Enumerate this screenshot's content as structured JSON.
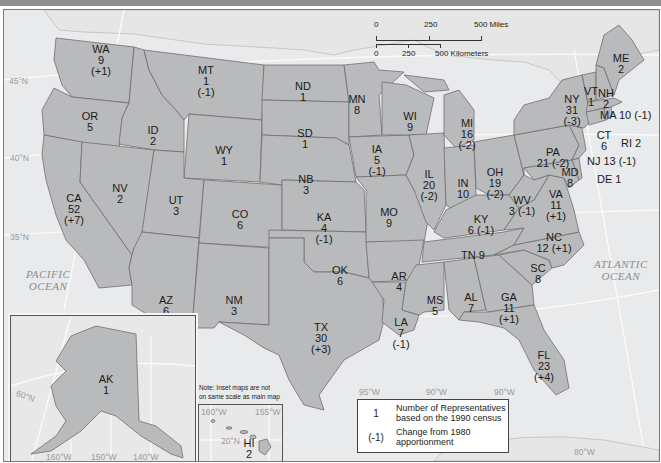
{
  "map": {
    "type": "choropleth-labeled",
    "subject": "U.S. House apportionment by state after the 1990 census",
    "states": [
      {
        "abbr": "WA",
        "reps": "9",
        "change": "(+1)"
      },
      {
        "abbr": "OR",
        "reps": "5",
        "change": ""
      },
      {
        "abbr": "CA",
        "reps": "52",
        "change": "(+7)"
      },
      {
        "abbr": "ID",
        "reps": "2",
        "change": ""
      },
      {
        "abbr": "NV",
        "reps": "2",
        "change": ""
      },
      {
        "abbr": "MT",
        "reps": "1",
        "change": "(-1)"
      },
      {
        "abbr": "WY",
        "reps": "1",
        "change": ""
      },
      {
        "abbr": "UT",
        "reps": "3",
        "change": ""
      },
      {
        "abbr": "AZ",
        "reps": "6",
        "change": "(+1)"
      },
      {
        "abbr": "CO",
        "reps": "6",
        "change": ""
      },
      {
        "abbr": "NM",
        "reps": "3",
        "change": ""
      },
      {
        "abbr": "ND",
        "reps": "1",
        "change": ""
      },
      {
        "abbr": "SD",
        "reps": "1",
        "change": ""
      },
      {
        "abbr": "NB",
        "reps": "3",
        "change": ""
      },
      {
        "abbr": "KA",
        "reps": "4",
        "change": "(-1)"
      },
      {
        "abbr": "OK",
        "reps": "6",
        "change": ""
      },
      {
        "abbr": "TX",
        "reps": "30",
        "change": "(+3)"
      },
      {
        "abbr": "MN",
        "reps": "8",
        "change": ""
      },
      {
        "abbr": "IA",
        "reps": "5",
        "change": "(-1)"
      },
      {
        "abbr": "MO",
        "reps": "9",
        "change": ""
      },
      {
        "abbr": "AR",
        "reps": "4",
        "change": ""
      },
      {
        "abbr": "LA",
        "reps": "7",
        "change": "(-1)"
      },
      {
        "abbr": "WI",
        "reps": "9",
        "change": ""
      },
      {
        "abbr": "IL",
        "reps": "20",
        "change": "(-2)"
      },
      {
        "abbr": "MI",
        "reps": "16",
        "change": "(-2)"
      },
      {
        "abbr": "IN",
        "reps": "10",
        "change": ""
      },
      {
        "abbr": "OH",
        "reps": "19",
        "change": "(-2)"
      },
      {
        "abbr": "KY",
        "reps": "6",
        "change": "(-1)"
      },
      {
        "abbr": "TN",
        "reps": "9",
        "change": ""
      },
      {
        "abbr": "MS",
        "reps": "5",
        "change": ""
      },
      {
        "abbr": "AL",
        "reps": "7",
        "change": ""
      },
      {
        "abbr": "GA",
        "reps": "11",
        "change": "(+1)"
      },
      {
        "abbr": "FL",
        "reps": "23",
        "change": "(+4)"
      },
      {
        "abbr": "SC",
        "reps": "8",
        "change": ""
      },
      {
        "abbr": "NC",
        "reps": "12",
        "change": "(+1)"
      },
      {
        "abbr": "VA",
        "reps": "11",
        "change": "(+1)"
      },
      {
        "abbr": "WV",
        "reps": "3",
        "change": "(-1)"
      },
      {
        "abbr": "PA",
        "reps": "21",
        "change": "(-2)"
      },
      {
        "abbr": "NY",
        "reps": "31",
        "change": "(-3)"
      },
      {
        "abbr": "VT",
        "reps": "1",
        "change": ""
      },
      {
        "abbr": "NH",
        "reps": "2",
        "change": ""
      },
      {
        "abbr": "ME",
        "reps": "2",
        "change": ""
      },
      {
        "abbr": "MA",
        "reps": "10",
        "change": "(-1)"
      },
      {
        "abbr": "RI",
        "reps": "2",
        "change": ""
      },
      {
        "abbr": "CT",
        "reps": "6",
        "change": ""
      },
      {
        "abbr": "NJ",
        "reps": "13",
        "change": "(-1)"
      },
      {
        "abbr": "DE",
        "reps": "1",
        "change": ""
      },
      {
        "abbr": "MD",
        "reps": "8",
        "change": ""
      },
      {
        "abbr": "AK",
        "reps": "1",
        "change": ""
      },
      {
        "abbr": "HI",
        "reps": "2",
        "change": ""
      }
    ],
    "inline_labels": {
      "MA": "MA 10 (-1)",
      "RI": "RI 2",
      "NJ": "NJ 13 (-1)",
      "DE": "DE 1",
      "TN": "TN 9",
      "KY": "6 (-1)",
      "WV": "3 (-1)",
      "PA": "21 (-2)",
      "NC": "12 (+1)"
    },
    "oceans": {
      "pacific_line1": "PACIFIC",
      "pacific_line2": "OCEAN",
      "atlantic_line1": "ATLANTIC",
      "atlantic_line2": "OCEAN"
    },
    "latitudes": {
      "lat45": "45°N",
      "lat40": "40°N",
      "lat35": "35°N"
    },
    "longitudes": {
      "lon95": "95°W",
      "lon90a": "90°W",
      "lon90b": "90°W",
      "lon80": "80°W"
    },
    "scale_bar": {
      "miles_0": "0",
      "miles_250": "250",
      "miles_500": "500 Miles",
      "km_0": "0",
      "km_250": "250",
      "km_500": "500 Kilometers"
    },
    "inset_alaska": {
      "lat60": "60°N",
      "lon160": "160°W",
      "lon150": "150°W",
      "lon140": "140°W"
    },
    "inset_hawaii": {
      "lon160": "160°W",
      "lon155": "155°W",
      "lat20": "20°N"
    },
    "note": {
      "line1": "Note: Inset maps are not",
      "line2": "on same scale as main map"
    },
    "legend": {
      "sym_reps": "1",
      "text_reps_line1": "Number of Representatives",
      "text_reps_line2": "based on the 1990 census",
      "sym_change": "(-1)",
      "text_change_line1": "Change from 1980",
      "text_change_line2": "apportionment"
    },
    "colors": {
      "state_fill": "#b9babc",
      "state_border": "#6e6f71",
      "background": "#ececec",
      "ocean_label": "#8a8c90",
      "grid_lines": "#fafafa"
    }
  }
}
